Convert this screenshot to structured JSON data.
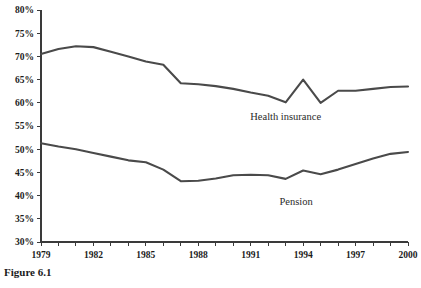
{
  "caption": "Figure 6.1",
  "chart_data": {
    "type": "line",
    "title": "",
    "xlabel": "",
    "ylabel": "",
    "grid": false,
    "legend_position": "inline-annotation",
    "xlim": [
      1979,
      2000
    ],
    "ylim": [
      30,
      80
    ],
    "ytick_labels": [
      "30%",
      "35%",
      "40%",
      "45%",
      "50%",
      "55%",
      "60%",
      "65%",
      "70%",
      "75%",
      "80%"
    ],
    "ytick_values": [
      30,
      35,
      40,
      45,
      50,
      55,
      60,
      65,
      70,
      75,
      80
    ],
    "xtick_labels": [
      "1979",
      "1982",
      "1985",
      "1988",
      "1991",
      "1994",
      "1997",
      "2000"
    ],
    "xtick_values": [
      1979,
      1982,
      1985,
      1988,
      1991,
      1994,
      1997,
      2000
    ],
    "x": [
      1979,
      1980,
      1981,
      1982,
      1983,
      1984,
      1985,
      1986,
      1987,
      1988,
      1989,
      1990,
      1991,
      1992,
      1993,
      1994,
      1995,
      1996,
      1997,
      1998,
      1999,
      2000
    ],
    "series": [
      {
        "name": "Health insurance",
        "label_text": "Health insurance",
        "values": [
          70.5,
          71.6,
          72.2,
          72.0,
          71.0,
          70.0,
          68.9,
          68.2,
          64.2,
          64.0,
          63.6,
          63.0,
          62.2,
          61.5,
          60.1,
          65.0,
          60.0,
          62.6,
          62.6,
          63.0,
          63.4,
          63.5
        ]
      },
      {
        "name": "Pension",
        "label_text": "Pension",
        "values": [
          51.3,
          50.6,
          50.0,
          49.2,
          48.4,
          47.6,
          47.2,
          45.6,
          43.1,
          43.2,
          43.7,
          44.4,
          44.5,
          44.4,
          43.6,
          45.4,
          44.6,
          45.6,
          46.8,
          48.0,
          49.0,
          49.4
        ]
      }
    ],
    "annotations": [
      {
        "text": "Health insurance",
        "x": 1993,
        "y": 56.2
      },
      {
        "text": "Pension",
        "x": 1993.6,
        "y": 38.0
      }
    ]
  }
}
